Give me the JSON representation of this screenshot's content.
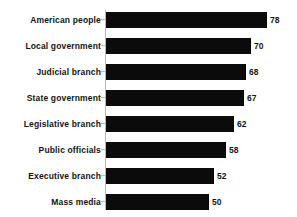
{
  "chart_data": {
    "type": "bar",
    "orientation": "horizontal",
    "title": "",
    "subtitle": "",
    "xlabel": "",
    "ylabel": "",
    "categories": [
      "American people",
      "Local government",
      "Judicial branch",
      "State government",
      "Legislative branch",
      "Public officials",
      "Executive branch",
      "Mass media"
    ],
    "values": [
      78,
      70,
      68,
      67,
      62,
      58,
      52,
      50
    ],
    "value_labels": [
      "78",
      "70",
      "68",
      "67",
      "62",
      "58",
      "52",
      "50"
    ],
    "xlim": [
      0,
      78
    ],
    "grid": false,
    "legend": false,
    "legend_position": "none",
    "bar_color": "#0b0b0b",
    "axis_color": "#b9b9b9",
    "text_color": "#131313",
    "background_color": "#ffffff"
  }
}
